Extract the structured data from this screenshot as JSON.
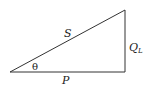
{
  "diagram": {
    "type": "power-triangle",
    "labels": {
      "hypotenuse": "S",
      "angle": "θ",
      "base": "P",
      "vertical_main": "Q",
      "vertical_sub": "L"
    },
    "vertices": {
      "left": [
        10,
        72
      ],
      "right_bottom": [
        125,
        72
      ],
      "top": [
        125,
        10
      ]
    },
    "stroke_color": "#333333"
  }
}
